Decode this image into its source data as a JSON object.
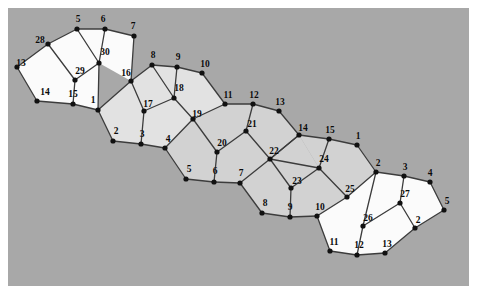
{
  "figure": {
    "canvas": {
      "width": 477,
      "height": 294
    },
    "background_color": "#ffffff",
    "plot_background_color": "#a8a8a8",
    "plot_rect": {
      "x": 8,
      "y": 8,
      "width": 461,
      "height": 278
    },
    "edge_color": "#3c3c3c",
    "vertex_color": "#111111",
    "face_fill_white": "#fbfbfb",
    "face_fill_light": "#e2e2e2",
    "face_fill_medium": "#d2d2d2",
    "vertex_radius": 2.6,
    "edge_width": 1.3
  },
  "vertices": [
    {
      "id": "v13",
      "label": "13",
      "x": 17,
      "y": 67,
      "lx": 21,
      "ly": 64,
      "fill": "#111111"
    },
    {
      "id": "v28",
      "label": "28",
      "x": 48,
      "y": 44,
      "lx": 40,
      "ly": 41,
      "fill": "#111111"
    },
    {
      "id": "v5",
      "label": "5",
      "x": 77,
      "y": 29,
      "lx": 78,
      "ly": 20,
      "fill": "#111111"
    },
    {
      "id": "v6",
      "label": "6",
      "x": 105,
      "y": 29,
      "lx": 103,
      "ly": 20,
      "fill": "#111111"
    },
    {
      "id": "v7",
      "label": "7",
      "x": 134,
      "y": 36,
      "lx": 133,
      "ly": 27,
      "fill": "#111111"
    },
    {
      "id": "v30",
      "label": "30",
      "x": 99,
      "y": 63,
      "lx": 105,
      "ly": 53,
      "fill": "#111111"
    },
    {
      "id": "v29",
      "label": "29",
      "x": 75,
      "y": 80,
      "lx": 80,
      "ly": 72,
      "fill": "#111111"
    },
    {
      "id": "v14",
      "label": "14",
      "x": 37,
      "y": 101,
      "lx": 45,
      "ly": 93,
      "fill": "#111111"
    },
    {
      "id": "v15",
      "label": "15",
      "x": 73,
      "y": 104,
      "lx": 73,
      "ly": 95,
      "fill": "#111111"
    },
    {
      "id": "v1a",
      "label": "1",
      "x": 98,
      "y": 110,
      "lx": 93,
      "ly": 101,
      "fill": "#111111"
    },
    {
      "id": "v16",
      "label": "16",
      "x": 131,
      "y": 81,
      "lx": 126,
      "ly": 74,
      "fill": "#111111"
    },
    {
      "id": "v8",
      "label": "8",
      "x": 152,
      "y": 65,
      "lx": 153,
      "ly": 56,
      "fill": "#111111"
    },
    {
      "id": "v9",
      "label": "9",
      "x": 177,
      "y": 67,
      "lx": 178,
      "ly": 58,
      "fill": "#111111"
    },
    {
      "id": "v10",
      "label": "10",
      "x": 202,
      "y": 73,
      "lx": 205,
      "ly": 65,
      "fill": "#111111"
    },
    {
      "id": "v18",
      "label": "18",
      "x": 174,
      "y": 98,
      "lx": 179,
      "ly": 89,
      "fill": "#111111"
    },
    {
      "id": "v17",
      "label": "17",
      "x": 144,
      "y": 111,
      "lx": 148,
      "ly": 105,
      "fill": "#111111"
    },
    {
      "id": "v2a",
      "label": "2",
      "x": 113,
      "y": 141,
      "lx": 116,
      "ly": 132,
      "fill": "#111111"
    },
    {
      "id": "v3a",
      "label": "3",
      "x": 141,
      "y": 144,
      "lx": 142,
      "ly": 135,
      "fill": "#111111"
    },
    {
      "id": "v19",
      "label": "19",
      "x": 193,
      "y": 119,
      "lx": 197,
      "ly": 115,
      "fill": "#111111"
    },
    {
      "id": "v11",
      "label": "11",
      "x": 225,
      "y": 104,
      "lx": 228,
      "ly": 96,
      "fill": "#111111"
    },
    {
      "id": "v12",
      "label": "12",
      "x": 253,
      "y": 104,
      "lx": 254,
      "ly": 96,
      "fill": "#111111"
    },
    {
      "id": "v13b",
      "label": "13",
      "x": 279,
      "y": 111,
      "lx": 280,
      "ly": 103,
      "fill": "#111111"
    },
    {
      "id": "v21",
      "label": "21",
      "x": 246,
      "y": 131,
      "lx": 252,
      "ly": 125,
      "fill": "#111111"
    },
    {
      "id": "v20",
      "label": "20",
      "x": 217,
      "y": 152,
      "lx": 222,
      "ly": 144,
      "fill": "#111111"
    },
    {
      "id": "v4a",
      "label": "4",
      "x": 165,
      "y": 148,
      "lx": 168,
      "ly": 140,
      "fill": "#111111"
    },
    {
      "id": "v5b",
      "label": "5",
      "x": 186,
      "y": 179,
      "lx": 189,
      "ly": 170,
      "fill": "#111111"
    },
    {
      "id": "v6b",
      "label": "6",
      "x": 214,
      "y": 182,
      "lx": 215,
      "ly": 172,
      "fill": "#111111"
    },
    {
      "id": "v7b",
      "label": "7",
      "x": 240,
      "y": 183,
      "lx": 241,
      "ly": 174,
      "fill": "#111111"
    },
    {
      "id": "v22",
      "label": "22",
      "x": 270,
      "y": 159,
      "lx": 274,
      "ly": 152,
      "fill": "#111111"
    },
    {
      "id": "v14b",
      "label": "14",
      "x": 299,
      "y": 135,
      "lx": 303,
      "ly": 129,
      "fill": "#111111"
    },
    {
      "id": "v15b",
      "label": "15",
      "x": 329,
      "y": 139,
      "lx": 330,
      "ly": 131,
      "fill": "#111111"
    },
    {
      "id": "v1b",
      "label": "1",
      "x": 357,
      "y": 145,
      "lx": 358,
      "ly": 137,
      "fill": "#111111"
    },
    {
      "id": "v24",
      "label": "24",
      "x": 319,
      "y": 168,
      "lx": 324,
      "ly": 160,
      "fill": "#111111"
    },
    {
      "id": "v23",
      "label": "23",
      "x": 291,
      "y": 188,
      "lx": 297,
      "ly": 182,
      "fill": "#111111"
    },
    {
      "id": "v8b",
      "label": "8",
      "x": 262,
      "y": 213,
      "lx": 265,
      "ly": 204,
      "fill": "#111111"
    },
    {
      "id": "v9b",
      "label": "9",
      "x": 290,
      "y": 217,
      "lx": 290,
      "ly": 208,
      "fill": "#111111"
    },
    {
      "id": "v10b",
      "label": "10",
      "x": 317,
      "y": 216,
      "lx": 320,
      "ly": 208,
      "fill": "#111111"
    },
    {
      "id": "v25",
      "label": "25",
      "x": 347,
      "y": 197,
      "lx": 350,
      "ly": 190,
      "fill": "#111111"
    },
    {
      "id": "v2b",
      "label": "2",
      "x": 376,
      "y": 172,
      "lx": 378,
      "ly": 164,
      "fill": "#111111"
    },
    {
      "id": "v3b",
      "label": "3",
      "x": 404,
      "y": 176,
      "lx": 405,
      "ly": 168,
      "fill": "#111111"
    },
    {
      "id": "v4b",
      "label": "4",
      "x": 430,
      "y": 182,
      "lx": 430,
      "ly": 174,
      "fill": "#111111"
    },
    {
      "id": "v5c",
      "label": "5",
      "x": 444,
      "y": 210,
      "lx": 447,
      "ly": 202,
      "fill": "#111111"
    },
    {
      "id": "v27",
      "label": "27",
      "x": 400,
      "y": 203,
      "lx": 405,
      "ly": 195,
      "fill": "#111111"
    },
    {
      "id": "v26",
      "label": "26",
      "x": 363,
      "y": 226,
      "lx": 368,
      "ly": 219,
      "fill": "#111111"
    },
    {
      "id": "v11b",
      "label": "11",
      "x": 330,
      "y": 251,
      "lx": 334,
      "ly": 243,
      "fill": "#111111"
    },
    {
      "id": "v12b",
      "label": "12",
      "x": 357,
      "y": 255,
      "lx": 359,
      "ly": 246,
      "fill": "#111111"
    },
    {
      "id": "v13c",
      "label": "13",
      "x": 385,
      "y": 253,
      "lx": 387,
      "ly": 245,
      "fill": "#111111"
    },
    {
      "id": "v2c",
      "label": "2",
      "x": 415,
      "y": 228,
      "lx": 418,
      "ly": 221,
      "fill": "#111111"
    }
  ],
  "faces": [
    {
      "id": "f-28-13-14-15-29",
      "fill": "#fbfbfb",
      "points": "48,44 17,67 37,101 73,104 75,80"
    },
    {
      "id": "f-5-28-29-30",
      "fill": "#fbfbfb",
      "points": "77,29 48,44 75,80 99,63"
    },
    {
      "id": "f-6-5-30",
      "fill": "#fbfbfb",
      "points": "105,29 77,29 99,63"
    },
    {
      "id": "f-6-30-16-7",
      "fill": "#fbfbfb",
      "points": "105,29 99,63 131,81 134,36"
    },
    {
      "id": "f-29-15-1-30",
      "fill": "#fbfbfb",
      "points": "75,80 73,104 98,110 99,63"
    },
    {
      "id": "f-1-16-17-3-2",
      "fill": "#e2e2e2",
      "points": "98,110 131,81 144,111 141,144 113,141"
    },
    {
      "id": "f-16-8-18-17",
      "fill": "#e2e2e2",
      "points": "131,81 152,65 174,98 144,111"
    },
    {
      "id": "f-8-9-18",
      "fill": "#e2e2e2",
      "points": "152,65 177,67 174,98"
    },
    {
      "id": "f-9-10-11-19-18",
      "fill": "#e2e2e2",
      "points": "177,67 202,73 225,104 193,119 174,98"
    },
    {
      "id": "f-17-18-19-4-3",
      "fill": "#e2e2e2",
      "points": "144,111 174,98 193,119 165,148 141,144"
    },
    {
      "id": "f-4-19-20-6-5",
      "fill": "#d2d2d2",
      "points": "165,148 193,119 217,152 214,182 186,179"
    },
    {
      "id": "f-11-12-21-20-19",
      "fill": "#d2d2d2",
      "points": "225,104 253,104 246,131 217,152 193,119"
    },
    {
      "id": "f-12-13-14-22-21",
      "fill": "#d2d2d2",
      "points": "253,104 279,111 299,135 270,159 246,131"
    },
    {
      "id": "f-20-21-22-7-6",
      "fill": "#d2d2d2",
      "points": "217,152 246,131 270,159 240,183 214,182"
    },
    {
      "id": "f-7-22-23-9-8",
      "fill": "#d2d2d2",
      "points": "240,183 270,159 291,188 290,217 262,213"
    },
    {
      "id": "f-22-14-24-23",
      "fill": "#d2d2d2",
      "points": "270,159 299,135 319,168 291,188"
    },
    {
      "id": "f-14-15-24",
      "fill": "#d2d2d2",
      "points": "299,135 329,139 319,168"
    },
    {
      "id": "f-15-1-2-25-24",
      "fill": "#d2d2d2",
      "points": "329,139 357,145 376,172 347,197 319,168"
    },
    {
      "id": "f-23-24-25-10-9",
      "fill": "#d2d2d2",
      "points": "291,188 319,168 347,197 317,216 290,217"
    },
    {
      "id": "f-25-2-26-12-11-10",
      "fill": "#fbfbfb",
      "points": "347,197 376,172 363,226 357,255 330,251 317,216"
    },
    {
      "id": "f-2-3-27-26",
      "fill": "#fbfbfb",
      "points": "376,172 404,176 400,203 363,226"
    },
    {
      "id": "f-3-4-5-2c-27",
      "fill": "#fbfbfb",
      "points": "404,176 430,182 444,210 415,228 400,203"
    },
    {
      "id": "f-27-2c-13-12-26",
      "fill": "#fbfbfb",
      "points": "400,203 415,228 385,253 357,255 363,226"
    }
  ],
  "edges": [
    "v13-v28",
    "v28-v5",
    "v5-v6",
    "v6-v7",
    "v7-v16",
    "v6-v30",
    "v5-v30",
    "v28-v29",
    "v30-v29",
    "v29-v15",
    "v13-v14",
    "v14-v15",
    "v15-v1a",
    "v1a-v30",
    "v1a-v16",
    "v16-v8",
    "v16-v17",
    "v8-v9",
    "v8-v18",
    "v9-v10",
    "v9-v18",
    "v10-v11",
    "v18-v17",
    "v18-v19",
    "v11-v19",
    "v11-v12",
    "v12-v13b",
    "v12-v21",
    "v13b-v14b",
    "v17-v3a",
    "v1a-v2a",
    "v2a-v3a",
    "v3a-v4a",
    "v19-v4a",
    "v19-v20",
    "v20-v21",
    "v21-v22",
    "v22-v14b",
    "v14b-v15b",
    "v14b-v22",
    "v15b-v1b",
    "v15b-v24",
    "v1b-v2b",
    "v24-v22",
    "v24-v23",
    "v24-v25",
    "v20-v6b",
    "v4a-v5b",
    "v5b-v6b",
    "v6b-v7b",
    "v7b-v22",
    "v7b-v8b",
    "v8b-v9b",
    "v9b-v23",
    "v9b-v10b",
    "v23-v22",
    "v10b-v25",
    "v25-v2b",
    "v2b-v3b",
    "v2b-v26",
    "v3b-v4b",
    "v3b-v27",
    "v4b-v5c",
    "v5c-v2c",
    "v27-v2c",
    "v27-v26",
    "v26-v12b",
    "v2c-v13c",
    "v13c-v12b",
    "v12b-v11b",
    "v11b-v10b"
  ],
  "labels": {
    "all": [
      "13",
      "28",
      "5",
      "6",
      "7",
      "30",
      "29",
      "14",
      "15",
      "1",
      "16",
      "8",
      "9",
      "10",
      "18",
      "17",
      "2",
      "3",
      "19",
      "11",
      "12",
      "13",
      "21",
      "20",
      "4",
      "5",
      "6",
      "7",
      "22",
      "14",
      "15",
      "1",
      "24",
      "23",
      "8",
      "9",
      "10",
      "25",
      "2",
      "3",
      "4",
      "5",
      "27",
      "26",
      "11",
      "12",
      "13",
      "2"
    ]
  }
}
